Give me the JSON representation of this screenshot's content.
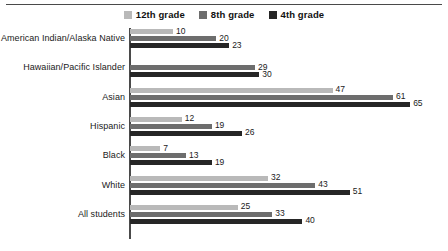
{
  "chart_data": {
    "type": "bar",
    "orientation": "horizontal",
    "title": "",
    "subtitle": "",
    "xlabel": "",
    "ylabel": "",
    "grid": false,
    "legend_position": "top-center",
    "xlim": [
      0,
      74
    ],
    "categories": [
      "American Indian/Alaska Native",
      "Hawaiian/Pacific Islander",
      "Asian",
      "Hispanic",
      "Black",
      "White",
      "All students"
    ],
    "series": [
      {
        "name": "12th grade",
        "color": "#b9b9b9",
        "values": [
          10,
          null,
          47,
          12,
          7,
          32,
          25
        ]
      },
      {
        "name": "8th grade",
        "color": "#6d6d6d",
        "values": [
          20,
          29,
          61,
          19,
          13,
          43,
          33
        ]
      },
      {
        "name": "4th grade",
        "color": "#262626",
        "values": [
          23,
          30,
          65,
          26,
          19,
          51,
          40
        ]
      }
    ]
  },
  "colors": {
    "grade12": "#b9b9b9",
    "grade8": "#6d6d6d",
    "grade4": "#262626",
    "axis": "#4a4a4a",
    "rule": "#4a4a4a",
    "text": "#1a1a1a",
    "background": "#ffffff"
  }
}
